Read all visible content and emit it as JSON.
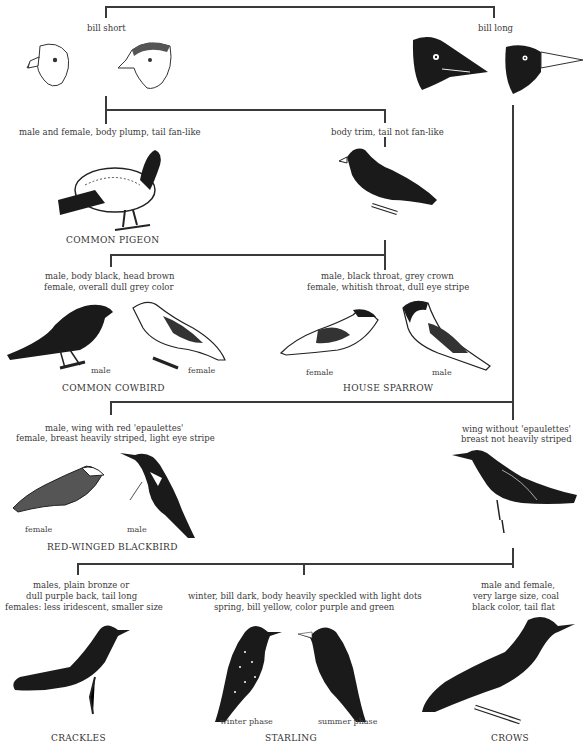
{
  "key": {
    "level1": {
      "left": "bill short",
      "right": "bill long"
    },
    "level2": {
      "left": "male and female, body plump, tail fan-like",
      "right": "body trim, tail not fan-like"
    },
    "pigeon": {
      "name": "COMMON PIGEON"
    },
    "level3": {
      "left": [
        "male, body black, head brown",
        "female, overall dull grey color"
      ],
      "right": [
        "male, black throat, grey crown",
        "female, whitish throat, dull eye stripe"
      ]
    },
    "cowbird": {
      "name": "COMMON COWBIRD",
      "male": "male",
      "female": "female"
    },
    "sparrow": {
      "name": "HOUSE SPARROW",
      "female": "female",
      "male": "male"
    },
    "level4": {
      "left": [
        "male, wing with red 'epaulettes'",
        "female, breast heavily striped, light eye stripe"
      ],
      "right": [
        "wing without 'epaulettes'",
        "breast not heavily striped"
      ]
    },
    "blackbird": {
      "name": "RED-WINGED BLACKBIRD",
      "female": "female",
      "male": "male"
    },
    "level5": {
      "left": [
        "males, plain bronze or",
        "dull purple back, tail long",
        "females: less iridescent, smaller size"
      ],
      "middle": [
        "winter, bill dark, body heavily speckled with light dots",
        "spring, bill yellow, color purple and green"
      ],
      "right": [
        "male and female,",
        "very large size, coal",
        "black color, tail flat"
      ]
    },
    "crackles": {
      "name": "CRACKLES"
    },
    "starling": {
      "name": "STARLING",
      "winter": "winter phase",
      "summer": "summer phase"
    },
    "crows": {
      "name": "CROWS"
    }
  }
}
